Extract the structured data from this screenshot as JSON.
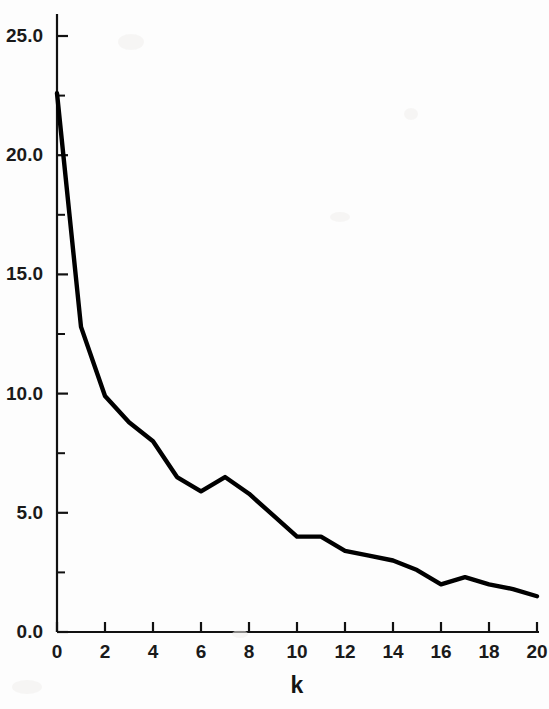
{
  "chart_data": {
    "type": "line",
    "title": "",
    "subtitle": "",
    "xlabel": "k",
    "ylabel": "",
    "x": [
      0,
      1,
      2,
      3,
      4,
      5,
      6,
      7,
      8,
      9,
      10,
      11,
      12,
      13,
      14,
      15,
      16,
      17,
      18,
      19,
      20
    ],
    "values": [
      22.6,
      12.8,
      9.9,
      8.8,
      8.0,
      6.5,
      5.9,
      6.5,
      5.8,
      4.9,
      4.0,
      4.0,
      3.4,
      3.2,
      3.0,
      2.6,
      2.0,
      2.3,
      2.0,
      1.8,
      1.5
    ],
    "series": [
      {
        "name": "curve",
        "values": [
          22.6,
          12.8,
          9.9,
          8.8,
          8.0,
          6.5,
          5.9,
          6.5,
          5.8,
          4.9,
          4.0,
          4.0,
          3.4,
          3.2,
          3.0,
          2.6,
          2.0,
          2.3,
          2.0,
          1.8,
          1.5
        ]
      }
    ],
    "xlim": [
      0,
      20
    ],
    "ylim": [
      0,
      26
    ],
    "grid": false,
    "legend": null,
    "legend_position": "none",
    "line_color": "#000000",
    "axis_color": "#111111",
    "background_color": "#fdfdfd",
    "y_ticks_major": [
      0.0,
      5.0,
      10.0,
      15.0,
      20.0,
      25.0
    ],
    "y_tick_labels": [
      "0.0",
      "5.0",
      "10.0",
      "15.0",
      "20.0",
      "25.0"
    ],
    "y_ticks_minor": [
      2.5,
      7.5,
      12.5,
      17.5,
      22.5
    ],
    "x_ticks_major": [
      0,
      2,
      4,
      6,
      8,
      10,
      12,
      14,
      16,
      18,
      20
    ],
    "x_tick_labels": [
      "0",
      "2",
      "4",
      "6",
      "8",
      "10",
      "12",
      "14",
      "16",
      "18",
      "20"
    ]
  }
}
